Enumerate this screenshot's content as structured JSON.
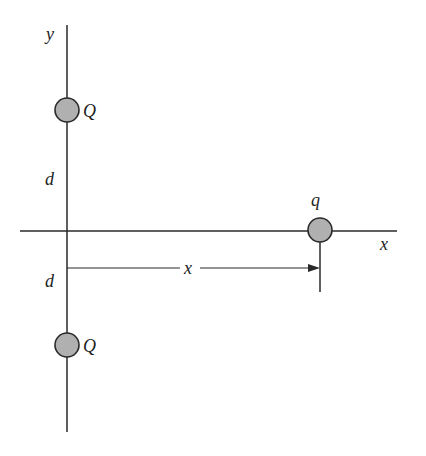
{
  "diagram": {
    "colors": {
      "line": "#2a2a2a",
      "charge_fill": "#b0b0b0",
      "charge_stroke": "#2a2a2a",
      "background": "#ffffff"
    },
    "axes": {
      "y_label": "y",
      "x_label": "x"
    },
    "charges": [
      {
        "label": "Q",
        "position": "top",
        "cx": 67,
        "cy": 110
      },
      {
        "label": "Q",
        "position": "bottom",
        "cx": 67,
        "cy": 345
      },
      {
        "label": "q",
        "position": "on-x-axis",
        "cx": 320,
        "cy": 230
      }
    ],
    "distances": {
      "upper_d": "d",
      "lower_d": "d",
      "horizontal": "x"
    }
  }
}
